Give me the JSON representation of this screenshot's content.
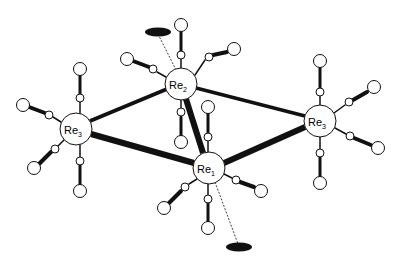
{
  "atoms": {
    "re2": {
      "label": "Re",
      "sub": "2",
      "x": 181,
      "y": 84
    },
    "re1": {
      "label": "Re",
      "sub": "1",
      "x": 209,
      "y": 168
    },
    "re3_left": {
      "label": "Re",
      "sub": "3",
      "x": 76,
      "y": 129
    },
    "re3_right": {
      "label": "Re",
      "sub": "3",
      "x": 320,
      "y": 121
    }
  },
  "colors": {
    "line": "#111111",
    "fill": "#ffffff",
    "ellipse": "#111111"
  }
}
